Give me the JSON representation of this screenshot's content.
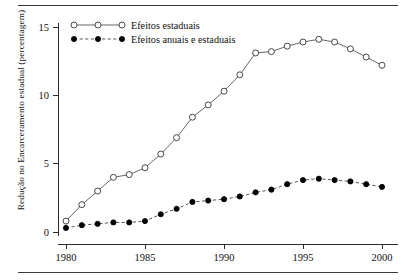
{
  "figure": {
    "has_top_rule": true,
    "has_bottom_rule": true
  },
  "chart_data": {
    "type": "line",
    "title": "",
    "xlabel": "",
    "ylabel": "Redução no Encarceramento estadual  (percentagem)",
    "x": [
      1980,
      1981,
      1982,
      1983,
      1984,
      1985,
      1986,
      1987,
      1988,
      1989,
      1990,
      1991,
      1992,
      1993,
      1994,
      1995,
      1996,
      1997,
      1998,
      1999,
      2000
    ],
    "xlim": [
      1979.5,
      2000.6
    ],
    "ylim": [
      -0.35,
      15.6
    ],
    "xticks": [
      1980,
      1985,
      1990,
      1995,
      2000
    ],
    "xtick_labels": [
      "1980",
      "1985",
      "1990",
      "1995",
      "2000"
    ],
    "yticks": [
      0,
      5,
      10,
      15
    ],
    "ytick_labels": [
      "0",
      "5",
      "10",
      "15"
    ],
    "grid": false,
    "legend_position": "top-left",
    "series": [
      {
        "name": "Efeitos  estaduais",
        "marker": "open-circle",
        "linestyle": "solid",
        "color": "#555555",
        "values": [
          0.8,
          2.0,
          3.0,
          4.0,
          4.2,
          4.7,
          5.7,
          6.9,
          8.4,
          9.3,
          10.3,
          11.5,
          13.1,
          13.2,
          13.6,
          13.9,
          14.1,
          13.9,
          13.4,
          12.8,
          12.2
        ]
      },
      {
        "name": "Efeitos anuais e estaduais",
        "marker": "filled-circle",
        "linestyle": "dashed",
        "color": "#000000",
        "values": [
          0.3,
          0.5,
          0.6,
          0.7,
          0.7,
          0.8,
          1.3,
          1.7,
          2.2,
          2.3,
          2.4,
          2.6,
          2.9,
          3.1,
          3.5,
          3.8,
          3.9,
          3.8,
          3.7,
          3.5,
          3.3
        ]
      }
    ]
  }
}
